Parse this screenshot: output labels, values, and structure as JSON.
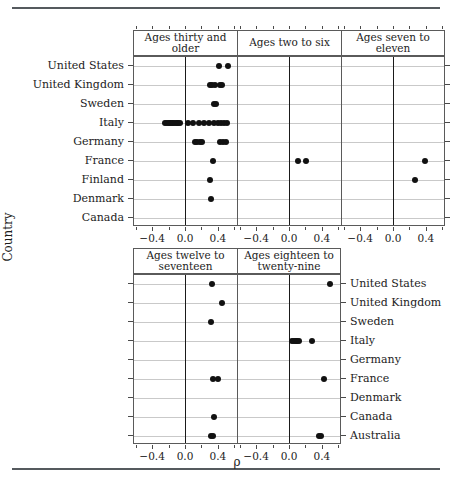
{
  "chart_data": {
    "type": "scatter",
    "title": "",
    "xlabel": "ρ",
    "ylabel": "Country",
    "xlim": [
      -0.62,
      0.62
    ],
    "xticks": [
      -0.4,
      0.0,
      0.4
    ],
    "xticklabels": [
      "−0.4",
      "0.0",
      "0.4"
    ],
    "xminorticks": [
      -0.6,
      -0.2,
      0.2,
      0.6
    ],
    "grid": "horizontal",
    "legend": "none",
    "panel_layout": "trellis 3 panels top row, 2 panels bottom row",
    "top_block": {
      "y_labels_side": "left",
      "categories": [
        "United States",
        "United Kingdom",
        "Sweden",
        "Italy",
        "Germany",
        "France",
        "Finland",
        "Denmark",
        "Canada"
      ],
      "panels": [
        {
          "label": "Ages thirty and older",
          "points": {
            "United States": [
              0.41,
              0.52
            ],
            "United Kingdom": [
              0.3,
              0.33,
              0.36,
              0.42,
              0.45
            ],
            "Sweden": [
              0.35,
              0.38
            ],
            "Italy": [
              -0.24,
              -0.22,
              -0.2,
              -0.18,
              -0.16,
              -0.14,
              -0.12,
              -0.1,
              -0.08,
              -0.06,
              0.04,
              0.1,
              0.17,
              0.23,
              0.29,
              0.35,
              0.4,
              0.44,
              0.48,
              0.51
            ],
            "Germany": [
              0.12,
              0.15,
              0.18,
              0.21,
              0.42,
              0.46,
              0.5
            ],
            "France": [
              0.34
            ],
            "Finland": [
              0.3
            ],
            "Denmark": [
              0.31
            ],
            "Canada": []
          }
        },
        {
          "label": "Ages two to six",
          "points": {
            "United States": [],
            "United Kingdom": [],
            "Sweden": [],
            "Italy": [],
            "Germany": [],
            "France": [
              0.11,
              0.21
            ],
            "Finland": [],
            "Denmark": [],
            "Canada": []
          }
        },
        {
          "label": "Ages seven to eleven",
          "points": {
            "United States": [],
            "United Kingdom": [],
            "Sweden": [],
            "Italy": [],
            "Germany": [],
            "France": [
              0.39
            ],
            "Finland": [
              0.27
            ],
            "Denmark": [],
            "Canada": []
          }
        }
      ]
    },
    "bottom_block": {
      "y_labels_side": "right",
      "categories": [
        "United States",
        "United Kingdom",
        "Sweden",
        "Italy",
        "Germany",
        "France",
        "Denmark",
        "Canada",
        "Australia"
      ],
      "panels": [
        {
          "label": "Ages twelve to seventeen",
          "points": {
            "United States": [
              0.33
            ],
            "United Kingdom": [
              0.45
            ],
            "Sweden": [
              0.32
            ],
            "Italy": [],
            "Germany": [],
            "France": [
              0.34,
              0.4
            ],
            "Denmark": [],
            "Canada": [
              0.35
            ],
            "Australia": [
              0.32,
              0.34
            ]
          }
        },
        {
          "label": "Ages eighteen to twenty-nine",
          "points": {
            "United States": [
              0.5
            ],
            "United Kingdom": [],
            "Sweden": [],
            "Italy": [
              0.04,
              0.06,
              0.08,
              0.1,
              0.12,
              0.28
            ],
            "Germany": [],
            "France": [
              0.43
            ],
            "Denmark": [],
            "Canada": [],
            "Australia": [
              0.36,
              0.39
            ]
          }
        }
      ]
    }
  }
}
